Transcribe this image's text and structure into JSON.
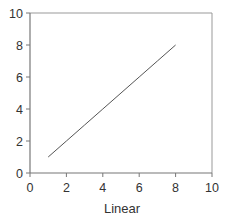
{
  "chart_data": {
    "type": "line",
    "title": "",
    "xlabel": "Linear",
    "ylabel": "",
    "xlim": [
      0,
      10
    ],
    "ylim": [
      0,
      10
    ],
    "x_ticks": [
      0,
      2,
      4,
      6,
      8,
      10
    ],
    "y_ticks": [
      0,
      2,
      4,
      6,
      8,
      10
    ],
    "grid": false,
    "legend": null,
    "series": [
      {
        "name": "Linear",
        "x": [
          1,
          2,
          3,
          4,
          5,
          6,
          7,
          8
        ],
        "y": [
          1,
          2,
          3,
          4,
          5,
          6,
          7,
          8
        ],
        "color": "#555555"
      }
    ]
  },
  "colors": {
    "axis": "#777777",
    "frame": "#999999",
    "line": "#555555",
    "text": "#333333"
  }
}
